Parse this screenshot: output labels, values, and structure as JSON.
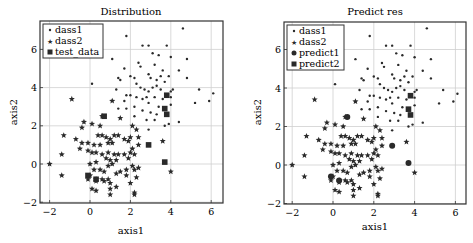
{
  "chart_data": [
    {
      "type": "scatter",
      "title": "Distribution",
      "xlabel": "axis1",
      "ylabel": "axis2",
      "xlim": [
        -2.5,
        6.5
      ],
      "ylim": [
        -2.1,
        7.4
      ],
      "xticks": [
        -2,
        0,
        2,
        4,
        6
      ],
      "yticks": [
        -2,
        0,
        2,
        4,
        6
      ],
      "grid": true,
      "legend_position": "upper left",
      "legend": [
        "dass1",
        "dass2",
        "test_data"
      ],
      "series": [
        {
          "name": "dass1",
          "marker": "dot",
          "points": [
            [
              4.6,
              7.1
            ],
            [
              1.8,
              6.7
            ],
            [
              2.6,
              6.2
            ],
            [
              2.9,
              6.2
            ],
            [
              3.8,
              6.2
            ],
            [
              3.1,
              5.8
            ],
            [
              3.4,
              5.7
            ],
            [
              1.1,
              5.5
            ],
            [
              4.0,
              5.6
            ],
            [
              4.8,
              5.5
            ],
            [
              2.4,
              5.3
            ],
            [
              2.5,
              5.1
            ],
            [
              1.7,
              5.0
            ],
            [
              3.2,
              5.2
            ],
            [
              3.6,
              4.9
            ],
            [
              4.4,
              4.9
            ],
            [
              2.0,
              4.6
            ],
            [
              2.2,
              4.5
            ],
            [
              2.9,
              4.7
            ],
            [
              3.0,
              4.5
            ],
            [
              3.3,
              4.4
            ],
            [
              3.5,
              4.6
            ],
            [
              3.7,
              4.3
            ],
            [
              3.9,
              4.6
            ],
            [
              4.8,
              4.5
            ],
            [
              1.4,
              4.5
            ],
            [
              1.5,
              4.4
            ],
            [
              0.1,
              4.2
            ],
            [
              2.3,
              4.2
            ],
            [
              2.5,
              4.0
            ],
            [
              2.7,
              3.9
            ],
            [
              2.9,
              3.8
            ],
            [
              3.1,
              4.0
            ],
            [
              3.3,
              4.1
            ],
            [
              3.5,
              3.9
            ],
            [
              4.0,
              3.8
            ],
            [
              4.1,
              3.9
            ],
            [
              5.4,
              3.9
            ],
            [
              1.3,
              3.9
            ],
            [
              1.8,
              3.6
            ],
            [
              2.0,
              3.6
            ],
            [
              2.3,
              3.5
            ],
            [
              2.6,
              3.4
            ],
            [
              2.8,
              3.5
            ],
            [
              3.2,
              3.5
            ],
            [
              3.6,
              3.4
            ],
            [
              4.0,
              3.5
            ],
            [
              6.1,
              3.7
            ],
            [
              5.9,
              3.3
            ],
            [
              5.2,
              3.2
            ],
            [
              1.7,
              3.3
            ],
            [
              2.9,
              3.2
            ],
            [
              3.4,
              3.0
            ],
            [
              4.0,
              3.1
            ],
            [
              2.2,
              3.0
            ],
            [
              1.4,
              2.9
            ],
            [
              1.8,
              2.9
            ],
            [
              2.6,
              2.8
            ],
            [
              3.0,
              2.7
            ],
            [
              3.3,
              2.6
            ],
            [
              2.2,
              2.5
            ],
            [
              2.8,
              2.3
            ],
            [
              3.2,
              2.3
            ],
            [
              3.9,
              2.1
            ],
            [
              4.4,
              2.2
            ],
            [
              2.9,
              1.8
            ],
            [
              3.7,
              2.0
            ]
          ]
        },
        {
          "name": "dass2",
          "marker": "star",
          "points": [
            [
              -0.9,
              3.4
            ],
            [
              1.1,
              3.3
            ],
            [
              1.5,
              2.4
            ],
            [
              0.6,
              2.5
            ],
            [
              -0.3,
              2.2
            ],
            [
              0.1,
              2.1
            ],
            [
              -0.4,
              1.9
            ],
            [
              0.5,
              2.0
            ],
            [
              2.1,
              2.0
            ],
            [
              2.3,
              1.8
            ],
            [
              -1.3,
              1.5
            ],
            [
              0.4,
              1.5
            ],
            [
              0.6,
              1.5
            ],
            [
              0.8,
              1.4
            ],
            [
              1.0,
              1.3
            ],
            [
              1.2,
              1.5
            ],
            [
              1.4,
              1.5
            ],
            [
              1.7,
              1.3
            ],
            [
              2.0,
              1.4
            ],
            [
              2.4,
              1.4
            ],
            [
              -0.7,
              1.3
            ],
            [
              -0.4,
              1.1
            ],
            [
              -0.1,
              1.1
            ],
            [
              0.2,
              1.0
            ],
            [
              0.5,
              1.0
            ],
            [
              0.9,
              1.1
            ],
            [
              1.1,
              1.1
            ],
            [
              1.9,
              1.2
            ],
            [
              2.4,
              1.0
            ],
            [
              3.6,
              1.2
            ],
            [
              -0.5,
              0.8
            ],
            [
              -0.1,
              0.7
            ],
            [
              0.1,
              0.6
            ],
            [
              0.3,
              0.6
            ],
            [
              0.6,
              0.5
            ],
            [
              0.9,
              0.6
            ],
            [
              1.2,
              0.5
            ],
            [
              1.4,
              0.5
            ],
            [
              1.7,
              0.5
            ],
            [
              2.0,
              0.6
            ],
            [
              2.2,
              0.5
            ],
            [
              2.1,
              0.8
            ],
            [
              -1.4,
              0.5
            ],
            [
              0.8,
              0.3
            ],
            [
              1.0,
              0.2
            ],
            [
              1.3,
              0.2
            ],
            [
              1.9,
              0.3
            ],
            [
              -2.0,
              0.0
            ],
            [
              0.0,
              0.0
            ],
            [
              0.3,
              0.1
            ],
            [
              0.9,
              -0.1
            ],
            [
              1.1,
              0.0
            ],
            [
              2.1,
              -0.1
            ],
            [
              2.4,
              -0.2
            ],
            [
              0.2,
              -0.3
            ],
            [
              0.5,
              -0.3
            ],
            [
              0.7,
              -0.4
            ],
            [
              1.5,
              -0.4
            ],
            [
              1.8,
              -0.3
            ],
            [
              2.2,
              -0.3
            ],
            [
              4.0,
              -0.4
            ],
            [
              -1.4,
              -0.6
            ],
            [
              0.0,
              -0.6
            ],
            [
              0.3,
              -0.8
            ],
            [
              0.6,
              -0.8
            ],
            [
              0.9,
              -0.8
            ],
            [
              1.3,
              -0.5
            ],
            [
              1.8,
              -0.6
            ],
            [
              2.3,
              -0.7
            ],
            [
              -0.1,
              -0.8
            ],
            [
              0.3,
              -0.9
            ],
            [
              0.7,
              -0.9
            ],
            [
              1.0,
              -1.0
            ],
            [
              2.0,
              -1.0
            ],
            [
              1.3,
              -1.2
            ],
            [
              0.1,
              -1.3
            ],
            [
              0.3,
              -1.4
            ],
            [
              1.0,
              -1.3
            ],
            [
              2.2,
              -1.5
            ],
            [
              2.2,
              -1.6
            ],
            [
              1.0,
              -1.6
            ]
          ]
        },
        {
          "name": "test_data",
          "marker": "square",
          "points": [
            [
              3.8,
              3.6
            ],
            [
              3.7,
              2.9
            ],
            [
              3.8,
              2.6
            ],
            [
              0.7,
              2.5
            ],
            [
              2.9,
              1.0
            ],
            [
              3.7,
              0.1
            ],
            [
              -0.1,
              -0.6
            ],
            [
              0.3,
              -0.8
            ]
          ]
        }
      ]
    },
    {
      "type": "scatter",
      "title": "Predict res",
      "xlabel": "axis1",
      "ylabel": "axis2",
      "xlim": [
        -2.5,
        6.5
      ],
      "ylim": [
        -2.1,
        7.4
      ],
      "xticks": [
        -2,
        0,
        2,
        4,
        6
      ],
      "yticks": [
        -2,
        0,
        2,
        4,
        6
      ],
      "grid": true,
      "legend_position": "upper left",
      "legend": [
        "dass1",
        "dass2",
        "predict1",
        "predict2"
      ],
      "series": [
        {
          "name": "dass1",
          "marker": "dot",
          "same_as": "Distribution.dass1"
        },
        {
          "name": "dass2",
          "marker": "star",
          "same_as": "Distribution.dass2"
        },
        {
          "name": "predict1",
          "marker": "circle",
          "points": [
            [
              0.7,
              2.5
            ],
            [
              3.7,
              0.1
            ],
            [
              2.9,
              1.0
            ],
            [
              -0.1,
              -0.6
            ],
            [
              0.3,
              -0.8
            ]
          ]
        },
        {
          "name": "predict2",
          "marker": "square",
          "points": [
            [
              3.8,
              3.6
            ],
            [
              3.7,
              2.9
            ],
            [
              3.8,
              2.6
            ]
          ]
        }
      ]
    }
  ],
  "panels": {
    "left": {
      "title": "Distribution",
      "xlabel": "axis1",
      "ylabel": "axis2",
      "legend": [
        "dass1",
        "dass2",
        "test_data"
      ]
    },
    "right": {
      "title": "Predict res",
      "xlabel": "axis1",
      "ylabel": "axis2",
      "legend": [
        "dass1",
        "dass2",
        "predict1",
        "predict2"
      ]
    }
  },
  "tick_labels": {
    "x": [
      "−2",
      "0",
      "2",
      "4",
      "6"
    ],
    "y": [
      "−2",
      "0",
      "2",
      "4",
      "6"
    ]
  },
  "colors": {
    "marker": "#2a2a2a",
    "grid": "#cfcfcf",
    "frame": "#333333",
    "text": "#222222"
  }
}
